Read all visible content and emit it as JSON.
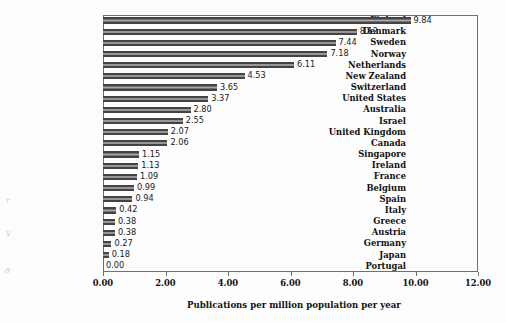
{
  "chart_data": {
    "type": "bar",
    "orientation": "horizontal",
    "title": "",
    "xlabel": "Publications per million population per year",
    "ylabel": "",
    "xlim": [
      0.0,
      12.0
    ],
    "xticks": [
      "0.00",
      "2.00",
      "4.00",
      "6.00",
      "8.00",
      "10.00",
      "12.00"
    ],
    "xtick_values": [
      0,
      2,
      4,
      6,
      8,
      10,
      12
    ],
    "grid": false,
    "legend": null,
    "categories": [
      "Finland",
      "Denmark",
      "Sweden",
      "Norway",
      "Netherlands",
      "New Zealand",
      "Switzerland",
      "United States",
      "Australia",
      "Israel",
      "United Kingdom",
      "Canada",
      "Singapore",
      "Ireland",
      "France",
      "Belgium",
      "Spain",
      "Italy",
      "Greece",
      "Austria",
      "Germany",
      "Japan",
      "Portugal"
    ],
    "values": [
      9.84,
      8.12,
      7.44,
      7.18,
      6.11,
      4.53,
      3.65,
      3.37,
      2.8,
      2.55,
      2.07,
      2.06,
      1.15,
      1.13,
      1.09,
      0.99,
      0.94,
      0.42,
      0.38,
      0.38,
      0.27,
      0.18,
      0.0
    ],
    "value_labels": [
      "9.84",
      "8.12",
      "7.44",
      "7.18",
      "6.11",
      "4.53",
      "3.65",
      "3.37",
      "2.80",
      "2.55",
      "2.07",
      "2.06",
      "1.15",
      "1.13",
      "1.09",
      "0.99",
      "0.94",
      "0.42",
      "0.38",
      "0.38",
      "0.27",
      "0.18",
      "0.00"
    ],
    "bar_color": "#434343"
  },
  "margin_artifacts": [
    {
      "text": "r",
      "left": 6,
      "top": 196
    },
    {
      "text": "y",
      "left": 6,
      "top": 228
    },
    {
      "text": "8",
      "left": 5,
      "top": 266
    }
  ]
}
